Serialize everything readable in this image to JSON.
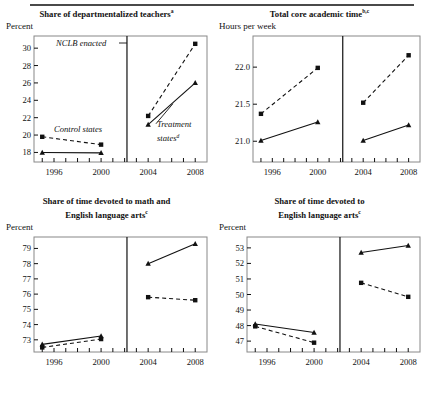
{
  "figure": {
    "has_top_rule": true,
    "panel_count": 4,
    "marker_control": "square",
    "marker_treatment": "triangle",
    "line_control": "dashed",
    "line_treatment": "solid",
    "color_ink": "#111111",
    "color_axis": "#888888",
    "color_divider": "#111111"
  },
  "annotations": {
    "nclb": "NCLB enacted",
    "control": "Control states",
    "treatment_line1": "Treatment",
    "treatment_line2": "states",
    "treatment_sup": "d"
  },
  "chart_data": [
    {
      "id": "departmentalized-teachers",
      "type": "line",
      "title": "Share of departmentalized teachers",
      "title_sup": "a",
      "ylabel": "Percent",
      "xlabel": "",
      "x": [
        1995,
        2000,
        2004,
        2008
      ],
      "xticklabels": [
        "1996",
        "2000",
        "2004",
        "2008"
      ],
      "xtickvalues": [
        1996,
        2000,
        2004,
        2008
      ],
      "xlim": [
        1994.3,
        2009.0
      ],
      "ylim": [
        16.9,
        31.4
      ],
      "yticks": [
        18,
        20,
        22,
        24,
        26,
        28,
        30
      ],
      "yticklabels": [
        "18",
        "20",
        "22",
        "24",
        "26",
        "28",
        "30"
      ],
      "divider_x": 2002.2,
      "grid": false,
      "legend": "inline-annotation",
      "series": [
        {
          "name": "Control states",
          "style": "dashed",
          "marker": "square",
          "pre_x": [
            1995,
            2000
          ],
          "pre_y": [
            19.8,
            18.9
          ],
          "post_x": [
            2004,
            2008
          ],
          "post_y": [
            22.2,
            30.5
          ]
        },
        {
          "name": "Treatment states",
          "style": "solid",
          "marker": "triangle",
          "pre_x": [
            1995,
            2000
          ],
          "pre_y": [
            18.0,
            17.95
          ],
          "post_x": [
            2004,
            2008
          ],
          "post_y": [
            21.2,
            26.0
          ]
        }
      ]
    },
    {
      "id": "total-core-academic-time",
      "type": "line",
      "title": "Total core academic time",
      "title_sup": "b,c",
      "ylabel": "Hours per week",
      "xlabel": "",
      "x": [
        1995,
        2000,
        2004,
        2008
      ],
      "xticklabels": [
        "1996",
        "2000",
        "2004",
        "2008"
      ],
      "xtickvalues": [
        1996,
        2000,
        2004,
        2008
      ],
      "xlim": [
        1994.3,
        2009.0
      ],
      "ylim": [
        20.72,
        22.42
      ],
      "yticks": [
        21.0,
        21.5,
        22.0
      ],
      "yticklabels": [
        "21.0",
        "21.5",
        "22.0"
      ],
      "divider_x": 2002.2,
      "grid": false,
      "legend": "none",
      "series": [
        {
          "name": "Control states",
          "style": "dashed",
          "marker": "square",
          "pre_x": [
            1995,
            2000
          ],
          "pre_y": [
            21.37,
            21.99
          ],
          "post_x": [
            2004,
            2008
          ],
          "post_y": [
            21.52,
            22.16
          ]
        },
        {
          "name": "Treatment states",
          "style": "solid",
          "marker": "triangle",
          "pre_x": [
            1995,
            2000
          ],
          "pre_y": [
            21.01,
            21.26
          ],
          "post_x": [
            2004,
            2008
          ],
          "post_y": [
            21.01,
            21.22
          ]
        }
      ]
    },
    {
      "id": "time-math-and-ela",
      "type": "line",
      "title_line1": "Share of time devoted to math and",
      "title_line2": "English language arts",
      "title_sup": "c",
      "ylabel": "Percent",
      "xlabel": "",
      "x": [
        1995,
        2000,
        2004,
        2008
      ],
      "xticklabels": [
        "1996",
        "2000",
        "2004",
        "2008"
      ],
      "xtickvalues": [
        1996,
        2000,
        2004,
        2008
      ],
      "xlim": [
        1994.3,
        2009.0
      ],
      "ylim": [
        72.2,
        79.75
      ],
      "yticks": [
        73,
        74,
        75,
        76,
        77,
        78,
        79
      ],
      "yticklabels": [
        "73",
        "74",
        "75",
        "76",
        "77",
        "78",
        "79"
      ],
      "divider_x": 2002.2,
      "grid": false,
      "legend": "none",
      "series": [
        {
          "name": "Control states",
          "style": "dashed",
          "marker": "square",
          "pre_x": [
            1995,
            2000
          ],
          "pre_y": [
            72.5,
            73.05
          ],
          "post_x": [
            2004,
            2008
          ],
          "post_y": [
            75.8,
            75.6
          ]
        },
        {
          "name": "Treatment states",
          "style": "solid",
          "marker": "triangle",
          "pre_x": [
            1995,
            2000
          ],
          "pre_y": [
            72.7,
            73.25
          ],
          "post_x": [
            2004,
            2008
          ],
          "post_y": [
            78.0,
            79.3
          ]
        }
      ]
    },
    {
      "id": "time-ela",
      "type": "line",
      "title_line1": "Share of time devoted to",
      "title_line2": "English language arts",
      "title_sup": "c",
      "ylabel": "Percent",
      "xlabel": "",
      "x": [
        1995,
        2000,
        2004,
        2008
      ],
      "xticklabels": [
        "1996",
        "2000",
        "2004",
        "2008"
      ],
      "xtickvalues": [
        1996,
        2000,
        2004,
        2008
      ],
      "xlim": [
        1994.3,
        2009.0
      ],
      "ylim": [
        46.3,
        53.7
      ],
      "yticks": [
        47,
        48,
        49,
        50,
        51,
        52,
        53
      ],
      "yticklabels": [
        "47",
        "48",
        "49",
        "50",
        "51",
        "52",
        "53"
      ],
      "divider_x": 2002.2,
      "grid": false,
      "legend": "none",
      "series": [
        {
          "name": "Control states",
          "style": "dashed",
          "marker": "square",
          "pre_x": [
            1995,
            2000
          ],
          "pre_y": [
            47.95,
            46.9
          ],
          "post_x": [
            2004,
            2008
          ],
          "post_y": [
            50.75,
            49.85
          ]
        },
        {
          "name": "Treatment states",
          "style": "solid",
          "marker": "triangle",
          "pre_x": [
            1995,
            2000
          ],
          "pre_y": [
            48.1,
            47.55
          ],
          "post_x": [
            2004,
            2008
          ],
          "post_y": [
            52.7,
            53.15
          ]
        }
      ]
    }
  ]
}
